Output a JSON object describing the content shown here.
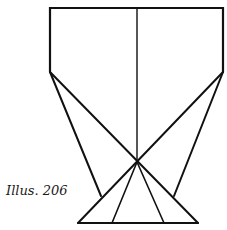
{
  "caption": "Illus. 206",
  "stroke_color": "#111111",
  "figure": {
    "rectangle": {
      "x1": 50,
      "y1": 8,
      "x2": 223,
      "y2": 72
    },
    "center_line": {
      "x": 137,
      "y1": 8,
      "y2": 162
    },
    "crossing_point": {
      "x": 137,
      "y": 162
    },
    "left_vertex": {
      "x": 50,
      "y": 72
    },
    "right_vertex": {
      "x": 223,
      "y": 72
    },
    "left_foot": {
      "x": 101,
      "y": 196
    },
    "right_foot": {
      "x": 174,
      "y": 196
    },
    "base": {
      "y": 223,
      "x1": 78,
      "x2": 198
    },
    "inner_base_points": [
      112,
      164
    ]
  }
}
